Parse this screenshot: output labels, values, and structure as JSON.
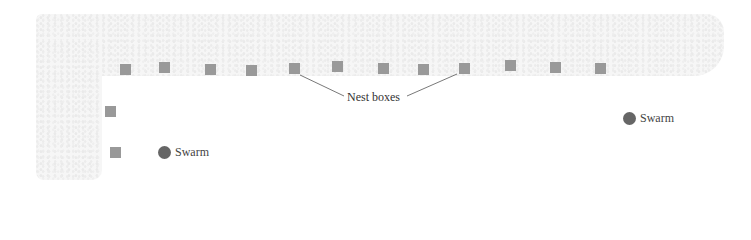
{
  "diagram": {
    "nest_label": "Nest boxes",
    "swarm_label": "Swarm",
    "colors": {
      "box": "#999999",
      "swarm": "#666666",
      "texture": "#f6f6f6",
      "leader_line": "#555555"
    },
    "nest_boxes_top_row": [
      {
        "x": 125,
        "y": 69
      },
      {
        "x": 164,
        "y": 67
      },
      {
        "x": 210,
        "y": 69
      },
      {
        "x": 251,
        "y": 70
      },
      {
        "x": 294,
        "y": 68
      },
      {
        "x": 337,
        "y": 66
      },
      {
        "x": 383,
        "y": 68
      },
      {
        "x": 423,
        "y": 69
      },
      {
        "x": 464,
        "y": 68
      },
      {
        "x": 510,
        "y": 65
      },
      {
        "x": 555,
        "y": 67
      },
      {
        "x": 600,
        "y": 68
      }
    ],
    "nest_boxes_left_column": [
      {
        "x": 110,
        "y": 111
      },
      {
        "x": 115,
        "y": 152
      }
    ],
    "swarms": [
      {
        "label": "Swarm",
        "x": 165,
        "y": 152
      },
      {
        "label": "Swarm",
        "x": 630,
        "y": 118
      }
    ]
  }
}
